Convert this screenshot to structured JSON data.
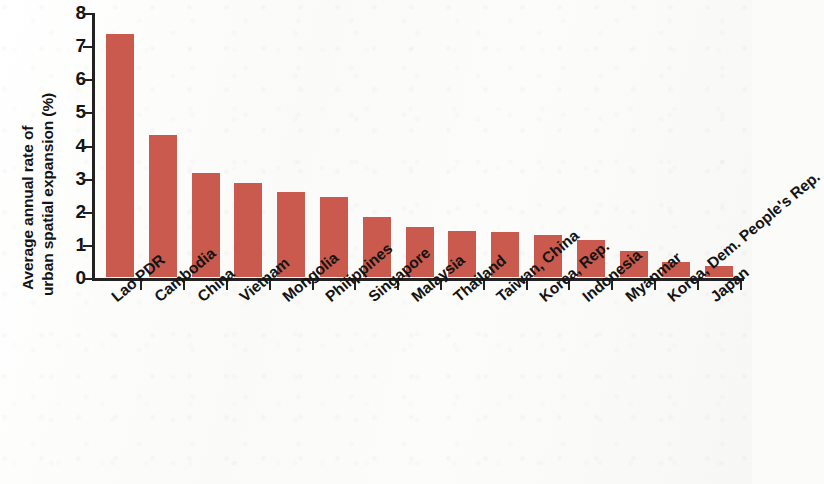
{
  "chart_data": {
    "type": "bar",
    "title": "",
    "xlabel": "",
    "ylabel": "Average annual rate of urban spatial expansion (%)",
    "ylabel_lines": [
      "Average annual rate of",
      "urban spatial expansion (%)"
    ],
    "ylim": [
      0,
      8
    ],
    "ytick_labels": [
      "8",
      "7",
      "6",
      "5",
      "4",
      "3",
      "2",
      "1",
      "0"
    ],
    "yticks": [
      8,
      7,
      6,
      5,
      4,
      3,
      2,
      1,
      0
    ],
    "grid": false,
    "legend": null,
    "bar_color": "#c95a4d",
    "categories": [
      "Lao PDR",
      "Cambodia",
      "China",
      "Vietnam",
      "Mongolia",
      "Philippines",
      "Singapore",
      "Malaysia",
      "Thailand",
      "Taiwan, China",
      "Korea, Rep.",
      "Indonesia",
      "Myanmar",
      "Korea, Dem. People's Rep.",
      "Japan"
    ],
    "values": [
      7.33,
      4.28,
      3.13,
      2.85,
      2.58,
      2.41,
      1.8,
      1.52,
      1.38,
      1.35,
      1.27,
      1.12,
      0.8,
      0.46,
      0.33
    ]
  }
}
